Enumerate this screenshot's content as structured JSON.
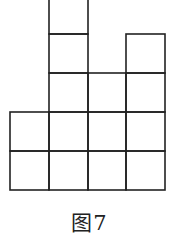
{
  "figure": {
    "caption": "图7",
    "line_color": "#222222",
    "cell_size": 39,
    "columns": [
      {
        "index": 0,
        "x": 10,
        "height_cells": 2
      },
      {
        "index": 1,
        "x": 49,
        "height_cells": 5
      },
      {
        "index": 2,
        "x": 88,
        "height_cells": 3
      },
      {
        "index": 3,
        "x": 126,
        "height_cells": 4
      }
    ],
    "baseline_y": 190
  }
}
